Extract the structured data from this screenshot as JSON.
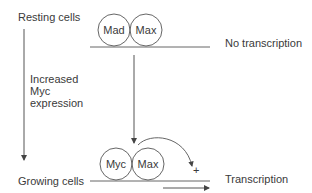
{
  "labels": {
    "resting_cells": "Resting cells",
    "growing_cells": "Growing cells",
    "increased_line1": "Increased",
    "increased_line2": "Myc",
    "increased_line3": "expression",
    "no_transcription": "No transcription",
    "transcription": "Transcription",
    "plus": "+"
  },
  "top_complex": {
    "left": "Mad",
    "right": "Max"
  },
  "bottom_complex": {
    "left": "Myc",
    "right": "Max"
  },
  "colors": {
    "line": "#555555",
    "text": "#3a3a3a",
    "background": "#ffffff"
  }
}
